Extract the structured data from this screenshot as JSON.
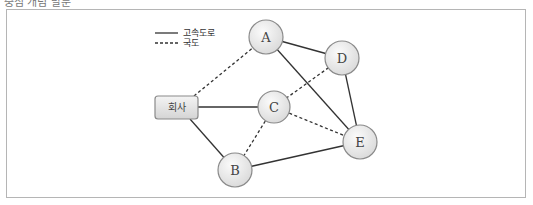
{
  "header": {
    "cut_text": "중심 개념 발문"
  },
  "legend": {
    "solid_label": "고속도로",
    "dashed_label": "국도"
  },
  "nodes": {
    "company": {
      "label": "회사",
      "x": 176,
      "y": 107
    },
    "A": {
      "label": "A",
      "x": 266,
      "y": 37
    },
    "B": {
      "label": "B",
      "x": 235,
      "y": 170
    },
    "C": {
      "label": "C",
      "x": 274,
      "y": 107
    },
    "D": {
      "label": "D",
      "x": 342,
      "y": 58
    },
    "E": {
      "label": "E",
      "x": 360,
      "y": 142
    }
  },
  "edges": [
    {
      "from": "company",
      "to": "A",
      "type": "국도"
    },
    {
      "from": "company",
      "to": "C",
      "type": "고속도로"
    },
    {
      "from": "company",
      "to": "B",
      "type": "고속도로"
    },
    {
      "from": "A",
      "to": "D",
      "type": "고속도로"
    },
    {
      "from": "A",
      "to": "E",
      "type": "고속도로"
    },
    {
      "from": "D",
      "to": "C",
      "type": "국도"
    },
    {
      "from": "D",
      "to": "E",
      "type": "고속도로"
    },
    {
      "from": "C",
      "to": "E",
      "type": "국도"
    },
    {
      "from": "C",
      "to": "B",
      "type": "국도"
    },
    {
      "from": "B",
      "to": "E",
      "type": "고속도로"
    }
  ],
  "colors": {
    "line": "#333333",
    "node_fill": "#e6e6e6",
    "node_stroke": "#8a8a8a",
    "frame": "#b5b5b5"
  }
}
